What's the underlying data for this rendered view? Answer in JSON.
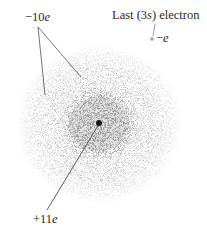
{
  "diagram": {
    "labels": {
      "inner_electrons": {
        "prefix": "−10",
        "italic": "e"
      },
      "last_electron_title": {
        "pre": "Last (3",
        "italic": "s",
        "post": ") electron"
      },
      "last_electron_charge": {
        "prefix": "−",
        "italic": "e"
      },
      "nucleus_charge": {
        "prefix": "+11",
        "italic": "e"
      }
    },
    "colors": {
      "cloud_outer": "#9a9a9a",
      "cloud_inner": "#7a7a7a",
      "nucleus": "#1a1a1a",
      "leader_lines": "#333333",
      "valence_electron": "#aaaaaa",
      "text": "#2a2a2a"
    }
  }
}
